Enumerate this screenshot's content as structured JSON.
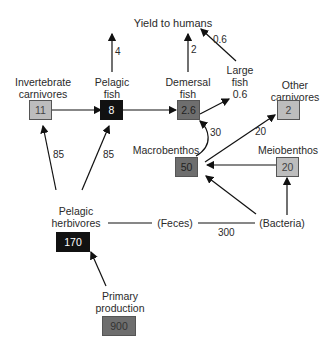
{
  "diagram": {
    "title": "Yield to humans",
    "nodes": {
      "invertebrate_carnivores": {
        "label_line1": "Invertebrate",
        "label_line2": "carnivores",
        "value": "11",
        "color": "#bdbdbd"
      },
      "pelagic_fish": {
        "label_line1": "Pelagic",
        "label_line2": "fish",
        "value": "8",
        "color": "#111111"
      },
      "demersal_fish": {
        "label_line1": "Demersal",
        "label_line2": "fish",
        "value": "2.6",
        "color": "#6e6e6e"
      },
      "large_fish": {
        "label_line1": "Large",
        "label_line2": "fish",
        "value": "0.6"
      },
      "other_carnivores": {
        "label_line1": "Other",
        "label_line2": "carnivores",
        "value": "2",
        "color": "#bdbdbd"
      },
      "macrobenthos": {
        "label": "Macrobenthos",
        "value": "50",
        "color": "#6e6e6e"
      },
      "meiobenthos": {
        "label": "Meiobenthos",
        "value": "20",
        "color": "#bdbdbd"
      },
      "pelagic_herbivores": {
        "label_line1": "Pelagic",
        "label_line2": "herbivores",
        "value": "170",
        "color": "#111111"
      },
      "primary_production": {
        "label_line1": "Primary",
        "label_line2": "production",
        "value": "900",
        "color": "#6e6e6e"
      },
      "feces": {
        "label": "(Feces)"
      },
      "bacteria": {
        "label": "(Bacteria)"
      }
    },
    "flows": {
      "pelagic_fish_to_humans": "4",
      "demersal_fish_to_humans": "2",
      "large_fish_to_humans": "0.6",
      "herbivores_to_invertebrate_carnivores": "85",
      "herbivores_to_pelagic_fish": "85",
      "macrobenthos_to_demersal_fish": "30",
      "macrobenthos_to_other_carnivores": "20",
      "feces_to_bacteria": "300"
    }
  }
}
